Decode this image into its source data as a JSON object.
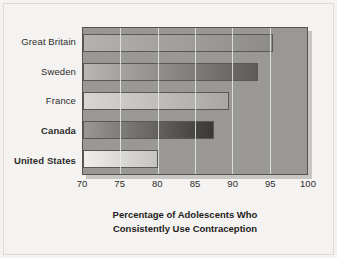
{
  "chart_data": {
    "type": "bar",
    "orientation": "horizontal",
    "title": "Percentage of Adolescents Who Consistently Use Contraception",
    "title_line1": "Percentage of Adolescents Who",
    "title_line2": "Consistently Use Contraception",
    "xlabel": "Percentage of Adolescents Who Consistently Use Contraception",
    "ylabel": "",
    "xlim": [
      70,
      100
    ],
    "xticks": [
      70,
      75,
      80,
      85,
      90,
      95,
      100
    ],
    "grid": true,
    "legend": "none",
    "categories": [
      "Great Britain",
      "Sweden",
      "France",
      "Canada",
      "United States"
    ],
    "values": [
      95.5,
      93.5,
      89.5,
      87.5,
      80
    ],
    "bars": [
      {
        "category": "Great Britain",
        "value": 95.5,
        "emphasis": false,
        "fill_start": "#b4b2ae",
        "fill_end": "#8e8c88"
      },
      {
        "category": "Sweden",
        "value": 93.5,
        "emphasis": false,
        "fill_start": "#b8b6b2",
        "fill_end": "#5e5c58"
      },
      {
        "category": "France",
        "value": 89.5,
        "emphasis": false,
        "fill_start": "#d8d6d2",
        "fill_end": "#a9a7a3"
      },
      {
        "category": "Canada",
        "value": 87.5,
        "emphasis": true,
        "fill_start": "#9a9894",
        "fill_end": "#3a3836"
      },
      {
        "category": "United States",
        "value": 80.0,
        "emphasis": true,
        "fill_start": "#efeeec",
        "fill_end": "#c6c4c0"
      }
    ],
    "colors": {
      "plot_background": "#9a9894",
      "gridline": "#e8e7e4",
      "axis_line": "#55534f",
      "figure_background": "#f4f3f1",
      "text": "#2e2c2a"
    }
  }
}
